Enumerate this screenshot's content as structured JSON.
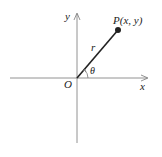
{
  "diagram": {
    "type": "polar-coordinates",
    "axes": {
      "x_label": "x",
      "y_label": "y"
    },
    "origin_label": "O",
    "point_label": "P(x, y)",
    "radius_label": "r",
    "angle_label": "θ",
    "colors": {
      "ink": "#222222",
      "axis": "#777777",
      "background": "#ffffff"
    }
  }
}
